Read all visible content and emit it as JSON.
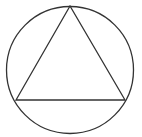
{
  "diagram": {
    "type": "geometry",
    "stroke_color": "#333333",
    "background": "#ffffff",
    "circle": {
      "cx": 70,
      "cy": 70,
      "r": 63.5
    },
    "triangle": {
      "vertices": [
        {
          "x": 70,
          "y": 6
        },
        {
          "x": 16,
          "y": 100
        },
        {
          "x": 125,
          "y": 100
        }
      ]
    }
  }
}
